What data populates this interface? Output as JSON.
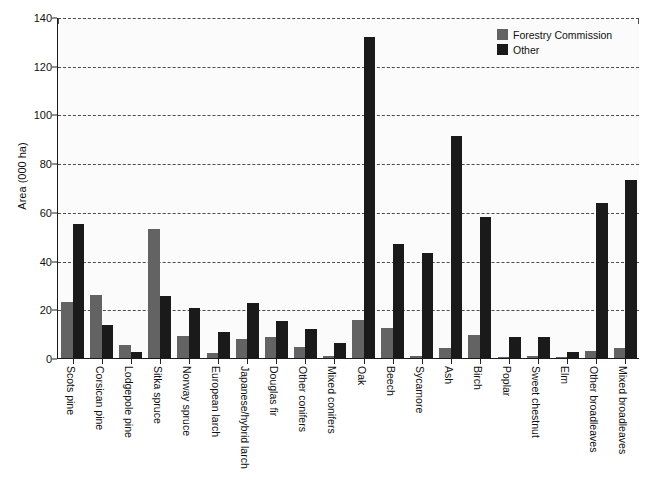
{
  "chart_data": {
    "type": "bar",
    "title": "",
    "xlabel": "",
    "ylabel": "Area (000 ha)",
    "ylim": [
      0,
      140
    ],
    "yticks": [
      0,
      20,
      40,
      60,
      80,
      100,
      120,
      140
    ],
    "grid": true,
    "legend_position": "top-right",
    "categories": [
      "Scots pine",
      "Corsican pine",
      "Lodgepole pine",
      "Sitka spruce",
      "Norway spruce",
      "European larch",
      "Japanese/hybrid larch",
      "Douglas fir",
      "Other conifers",
      "Mixed conifers",
      "Oak",
      "Beech",
      "Sycamore",
      "Ash",
      "Birch",
      "Poplar",
      "Sweet chestnut",
      "Elm",
      "Other broadleaves",
      "Mixed broadleaves"
    ],
    "series": [
      {
        "name": "Forestry Commission",
        "color": "#636363",
        "values": [
          23,
          26,
          5.5,
          53,
          9,
          2,
          8,
          8.5,
          4.5,
          1,
          15.5,
          12.5,
          1,
          4,
          9.5,
          0.3,
          0.8,
          0.3,
          3,
          4
        ]
      },
      {
        "name": "Other",
        "color": "#1a1a1a",
        "values": [
          55,
          13.5,
          2.5,
          25.5,
          20.5,
          10.5,
          22.5,
          15,
          12,
          6,
          132,
          47,
          43,
          91,
          58,
          8.5,
          8.5,
          2.5,
          63.5,
          73
        ]
      }
    ]
  },
  "legend": {
    "items": [
      {
        "label": "Forestry Commission",
        "swatch": "fc"
      },
      {
        "label": "Other",
        "swatch": "other"
      }
    ]
  },
  "axis": {
    "y_title": "Area (000 ha)"
  }
}
